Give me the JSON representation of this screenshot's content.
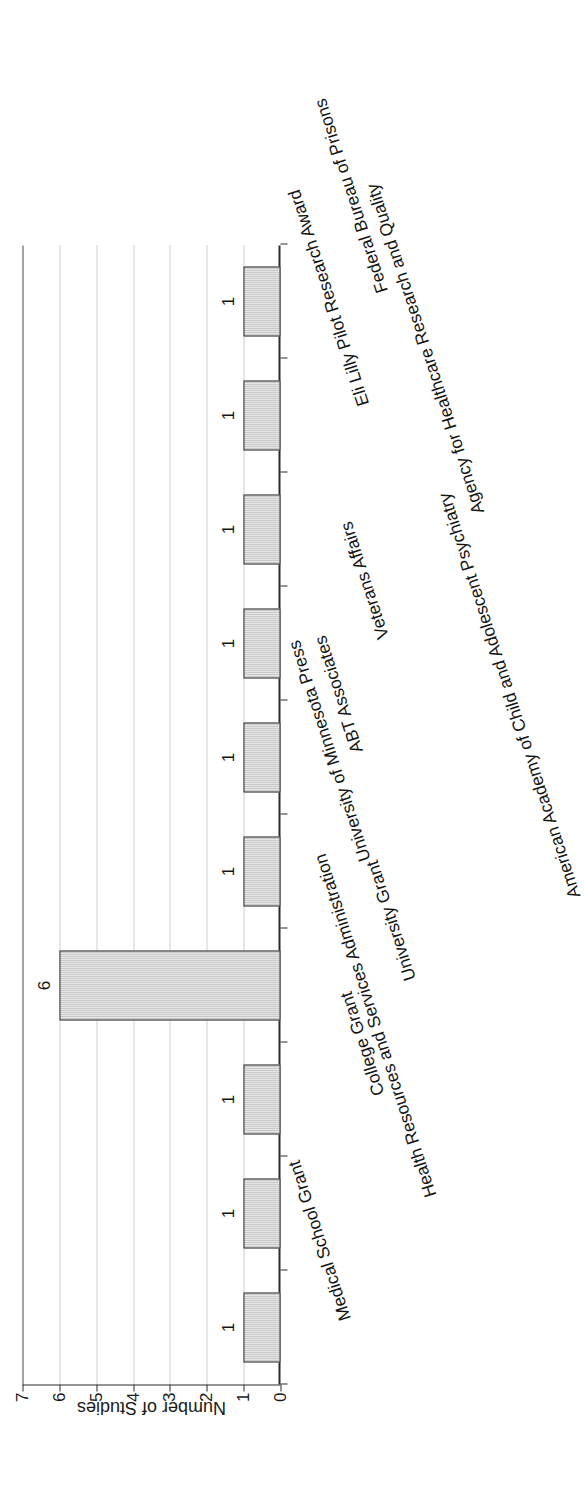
{
  "chart_data": {
    "type": "bar",
    "orientation": "vertical",
    "title": "",
    "xlabel": "",
    "ylabel": "Number of Studies",
    "ylim": [
      0,
      7
    ],
    "yticks": [
      0,
      1,
      2,
      3,
      4,
      5,
      6,
      7
    ],
    "ytick_labels": [
      "0",
      "1",
      "2",
      "3",
      "4",
      "5",
      "6",
      "7"
    ],
    "grid": true,
    "legend": false,
    "bar_fill": "#b4b4b4",
    "bar_edge": "#3a3a3a",
    "categories": [
      "Medical School Grant",
      "Health Resources and Services Administration",
      "College Grant",
      "University Grant",
      "University of Minnesota Press",
      "ABT Associates",
      "Veterans Affairs",
      "Agency for Healthcare Research and Quality",
      "Eli Lilly Pilot Research Award",
      "Federal Bureau of  Prisons"
    ],
    "values": [
      1,
      1,
      1,
      6,
      1,
      1,
      1,
      1,
      1,
      1
    ],
    "data_labels": [
      "1",
      "1",
      "1",
      "6",
      "1",
      "1",
      "1",
      "1",
      "1",
      "1"
    ],
    "annotations": [
      "American Academy of Child and Adolescent Psychiatry"
    ]
  },
  "axis": {
    "value_axis_title": "Number of Studies",
    "tick_labels": [
      "7",
      "6",
      "5",
      "4",
      "3",
      "2",
      "1",
      "0"
    ]
  }
}
